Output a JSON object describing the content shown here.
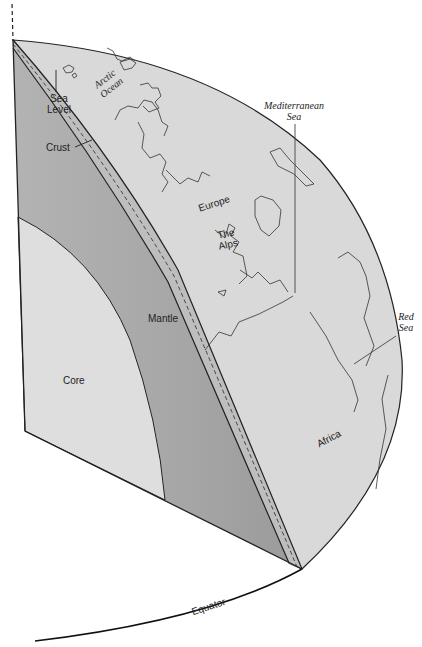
{
  "figure": {
    "layers": [
      {
        "name": "Core",
        "color": "#dcdcdc"
      },
      {
        "name": "Mantle",
        "color": "#a9a9a9"
      },
      {
        "name": "Crust",
        "color": "#bdbdbd"
      }
    ],
    "surface_color": "#d8d8d8",
    "outline_color": "#222222"
  },
  "labels": {
    "sea_level_line1": "Sea",
    "sea_level_line2": "Level",
    "crust": "Crust",
    "arctic_line1": "Arctic",
    "arctic_line2": "Ocean",
    "europe": "Europe",
    "alps_line1": "The",
    "alps_line2": "Alps",
    "med_line1": "Mediterranean",
    "med_line2": "Sea",
    "red_line1": "Red",
    "red_line2": "Sea",
    "mantle": "Mantle",
    "core": "Core",
    "africa": "Africa",
    "equator": "Equator"
  }
}
